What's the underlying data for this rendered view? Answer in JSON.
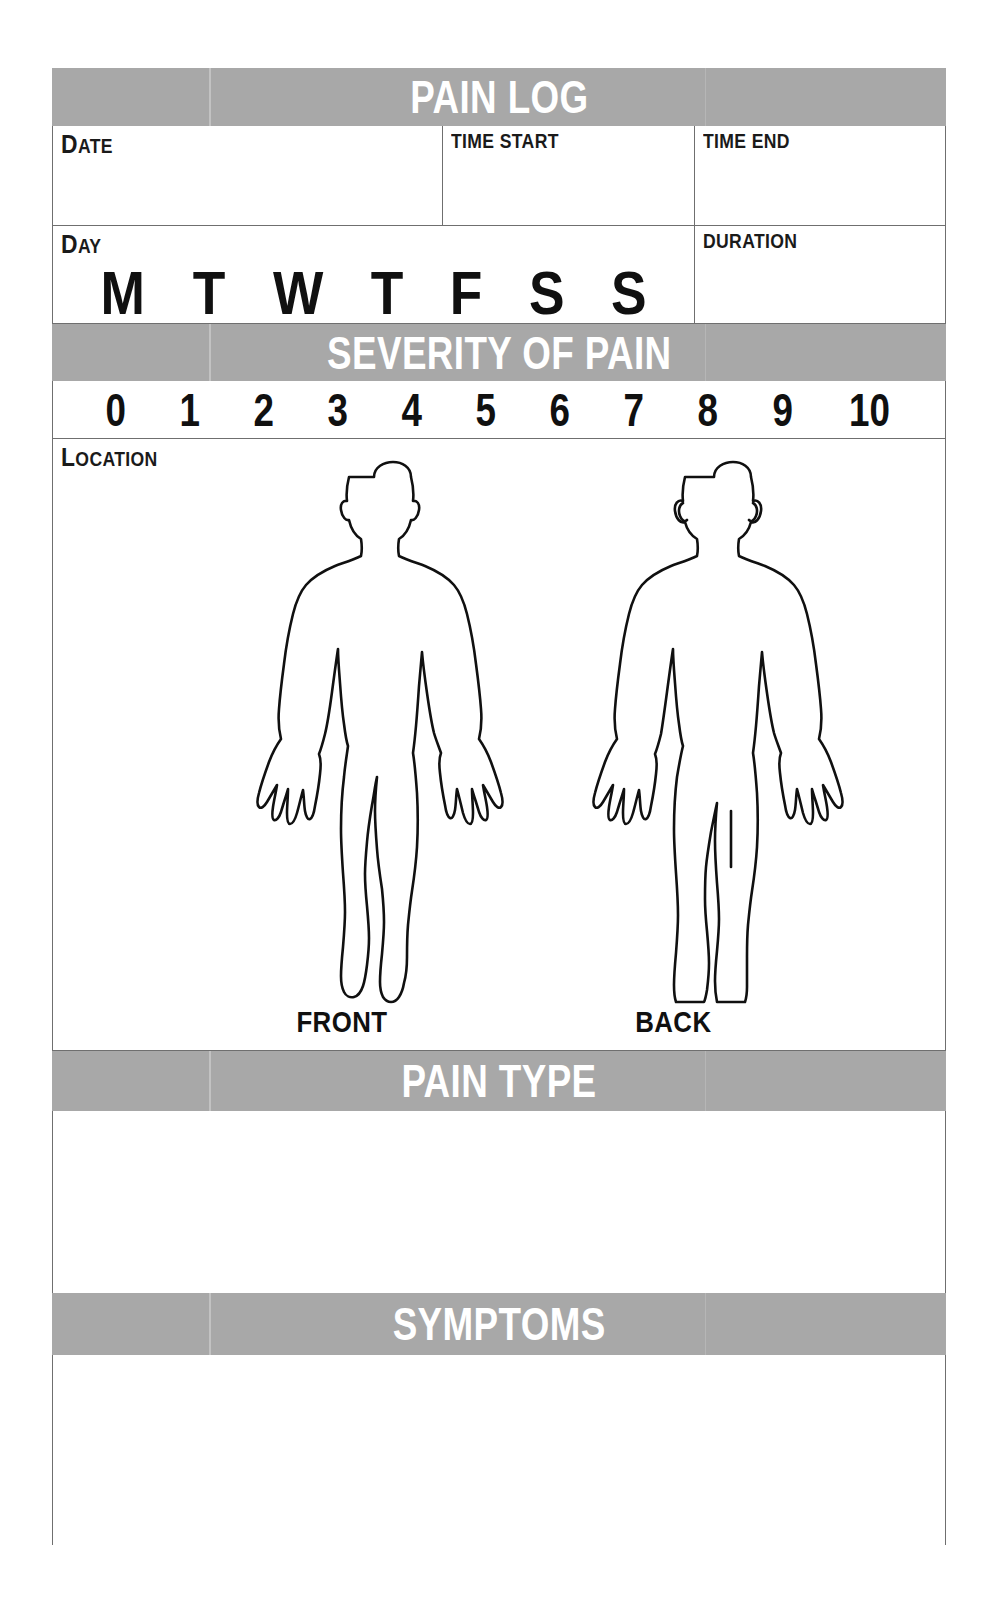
{
  "form": {
    "title": "PAIN LOG",
    "sections": {
      "severity_heading": "SEVERITY OF PAIN",
      "pain_type_heading": "PAIN TYPE",
      "symptoms_heading": "SYMPTOMS"
    },
    "fields": {
      "date": {
        "label": "DATE",
        "cap": "D",
        "rest": "ATE",
        "value": ""
      },
      "time_start": {
        "label": "TIME START",
        "value": ""
      },
      "time_end": {
        "label": "TIME END",
        "value": ""
      },
      "day": {
        "label": "DAY",
        "cap": "D",
        "rest": "AY"
      },
      "duration": {
        "label": "DURATION",
        "value": ""
      },
      "location": {
        "label": "LOCATION",
        "cap": "L",
        "rest": "OCATION"
      },
      "pain_type": {
        "value": ""
      },
      "symptoms": {
        "value": ""
      }
    },
    "day_options": [
      "M",
      "T",
      "W",
      "T",
      "F",
      "S",
      "S"
    ],
    "severity_scale": [
      "0",
      "1",
      "2",
      "3",
      "4",
      "5",
      "6",
      "7",
      "8",
      "9",
      "10"
    ],
    "body_figures": [
      {
        "name": "front-body-figure",
        "caption": "FRONT"
      },
      {
        "name": "back-body-figure",
        "caption": "BACK"
      }
    ],
    "colors": {
      "banner_background": "#a8a8a8",
      "banner_text": "#ffffff",
      "border": "#6f6f6f",
      "text": "#101010",
      "page_background": "#ffffff"
    }
  }
}
